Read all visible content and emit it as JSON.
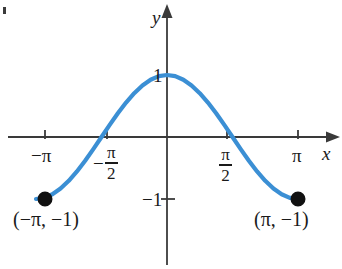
{
  "figure": {
    "kind": "cartesian-graph",
    "background_color": "#ffffff",
    "curve_color": "#3b8fd4",
    "axis_color": "#3a3a3a",
    "text_color": "#1a1a1a",
    "axes": {
      "x_label": "x",
      "y_label": "y",
      "x_arrow": "right",
      "y_arrow": "up"
    },
    "x_ticks": [
      {
        "name": "neg-pi",
        "label_plain": "−π",
        "type": "plain",
        "minus": "−",
        "text": "π",
        "value": -3.14159,
        "px": 45
      },
      {
        "name": "neg-pi-over-2",
        "label_plain": "−π/2",
        "type": "fraction",
        "minus": "−",
        "numerator": "π",
        "denominator": "2",
        "value": -1.5708,
        "px": 107
      },
      {
        "name": "pi-over-2",
        "label_plain": "π/2",
        "type": "fraction",
        "minus": "",
        "numerator": "π",
        "denominator": "2",
        "value": 1.5708,
        "px": 227
      },
      {
        "name": "pi",
        "label_plain": "π",
        "type": "plain",
        "minus": "",
        "text": "π",
        "value": 3.14159,
        "px": 298
      }
    ],
    "y_ticks": [
      {
        "name": "y-one",
        "label": "1",
        "value": 1,
        "px": 75
      },
      {
        "name": "y-neg-one",
        "label": "−1",
        "value": -1,
        "px": 199
      }
    ],
    "points": [
      {
        "name": "left-endpoint",
        "label": "(−π, −1)",
        "x": -3.14159,
        "y": -1,
        "px": 45,
        "py": 199,
        "filled": true
      },
      {
        "name": "right-endpoint",
        "label": "(π, −1)",
        "x": 3.14159,
        "y": -1,
        "px": 298,
        "py": 199,
        "filled": true
      }
    ]
  },
  "chart_data": {
    "type": "line",
    "title": "",
    "xlabel": "x",
    "ylabel": "y",
    "grid": false,
    "legend": null,
    "xlim": [
      -3.14159,
      3.14159
    ],
    "ylim": [
      -1,
      1
    ],
    "xticks": [
      -3.14159,
      -1.5708,
      1.5708,
      3.14159
    ],
    "xticklabels": [
      "−π",
      "−π/2",
      "π/2",
      "π"
    ],
    "yticks": [
      1,
      -1
    ],
    "yticklabels": [
      "1",
      "−1"
    ],
    "series": [
      {
        "name": "y = cos(x)",
        "color": "#3b8fd4",
        "x": [
          -3.14159,
          -2.94524,
          -2.74889,
          -2.55254,
          -2.35619,
          -2.15984,
          -1.9635,
          -1.76715,
          -1.5708,
          -1.37445,
          -1.1781,
          -0.98175,
          -0.7854,
          -0.58905,
          -0.3927,
          -0.19635,
          0.0,
          0.19635,
          0.3927,
          0.58905,
          0.7854,
          0.98175,
          1.1781,
          1.37445,
          1.5708,
          1.76715,
          1.9635,
          2.15984,
          2.35619,
          2.55254,
          2.74889,
          2.94524,
          3.14159
        ],
        "y": [
          -1.0,
          -0.98079,
          -0.92388,
          -0.83147,
          -0.70711,
          -0.55557,
          -0.38268,
          -0.19509,
          0.0,
          0.19509,
          0.38268,
          0.55557,
          0.70711,
          0.83147,
          0.92388,
          0.98079,
          1.0,
          0.98079,
          0.92388,
          0.83147,
          0.70711,
          0.55557,
          0.38268,
          0.19509,
          0.0,
          -0.19509,
          -0.38268,
          -0.55557,
          -0.70711,
          -0.83147,
          -0.92388,
          -0.98079,
          -1.0
        ]
      }
    ],
    "annotations": [
      {
        "text": "(−π, −1)",
        "x": -3.14159,
        "y": -1
      },
      {
        "text": "(π, −1)",
        "x": 3.14159,
        "y": -1
      }
    ]
  }
}
